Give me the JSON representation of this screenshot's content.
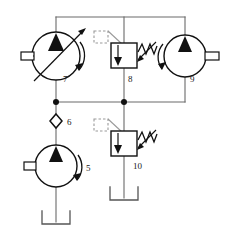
{
  "diagram": {
    "type": "hydraulic-schematic",
    "line_color": "#555555",
    "symbol_color": "#1a1a1a",
    "fill_color": "#111111",
    "background": "#ffffff",
    "components": [
      {
        "id": "5",
        "label": "5",
        "name": "fixed-displacement-pump",
        "symbol": "pump-circle-with-triangle",
        "shaft_side": "left",
        "rotation_arrow": "right",
        "label_x": 86,
        "label_y": 171,
        "cx": 56,
        "cy": 166,
        "r": 21
      },
      {
        "id": "6",
        "label": "6",
        "name": "check-valve",
        "symbol": "check-valve-diamond",
        "label_x": 67,
        "label_y": 125,
        "cx": 56,
        "cy": 121
      },
      {
        "id": "7",
        "label": "7",
        "name": "variable-displacement-pump",
        "symbol": "pump-circle-with-triangle-and-variable-arrow",
        "shaft_side": "left",
        "rotation_arrow": "right",
        "label_x": 63,
        "label_y": 82,
        "cx": 56,
        "cy": 56,
        "r": 24
      },
      {
        "id": "8",
        "label": "8",
        "name": "pilot-operated-relief-valve",
        "symbol": "relief-valve-box-with-spring-and-pilot",
        "label_x": 128,
        "label_y": 82,
        "box_x": 111,
        "box_y": 43,
        "box_w": 26,
        "box_h": 25
      },
      {
        "id": "9",
        "label": "9",
        "name": "fixed-displacement-pump",
        "symbol": "pump-circle-with-triangle",
        "shaft_side": "right",
        "rotation_arrow": "left",
        "label_x": 190,
        "label_y": 82,
        "cx": 185,
        "cy": 56,
        "r": 21
      },
      {
        "id": "10",
        "label": "10",
        "name": "pilot-operated-relief-valve",
        "symbol": "relief-valve-box-with-spring-and-pilot",
        "label_x": 133,
        "label_y": 169,
        "box_x": 111,
        "box_y": 131,
        "box_w": 26,
        "box_h": 25
      }
    ],
    "reservoirs": [
      {
        "name": "reservoir-pump-5",
        "x": 43,
        "y": 211,
        "w": 26,
        "h": 13
      },
      {
        "name": "reservoir-valve-10",
        "x": 111,
        "y": 187,
        "w": 26,
        "h": 13
      }
    ],
    "junctions": [
      {
        "name": "junction-left-rail",
        "cx": 56,
        "cy": 102
      },
      {
        "name": "junction-center-rail",
        "cx": 124,
        "cy": 102
      }
    ],
    "rails": [
      {
        "name": "top-pressure-rail",
        "x1": 56,
        "y1": 17,
        "x2": 185,
        "y2": 17
      },
      {
        "name": "bottom-pressure-rail",
        "x1": 56,
        "y1": 102,
        "x2": 185,
        "y2": 102
      }
    ]
  }
}
